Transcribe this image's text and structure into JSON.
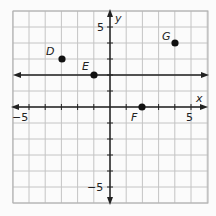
{
  "chart_data": {
    "type": "scatter",
    "title": "",
    "xlabel": "x",
    "ylabel": "y",
    "xlim": [
      -6,
      6
    ],
    "ylim": [
      -6,
      6
    ],
    "grid": true,
    "tick_labels": {
      "x": [
        "-5",
        "5"
      ],
      "y": [
        "5",
        "-5"
      ]
    },
    "points": [
      {
        "label": "D",
        "x": -3,
        "y": 3
      },
      {
        "label": "E",
        "x": -1,
        "y": 2
      },
      {
        "label": "F",
        "x": 2,
        "y": 0
      },
      {
        "label": "G",
        "x": 4,
        "y": 4
      }
    ],
    "lines": [
      {
        "type": "horizontal",
        "y": 2,
        "arrows": "both"
      }
    ]
  },
  "labels": {
    "x_axis": "x",
    "y_axis": "y",
    "x_neg": "−5",
    "x_pos": "5",
    "y_pos": "5",
    "y_neg": "−5",
    "D": "D",
    "E": "E",
    "F": "F",
    "G": "G"
  },
  "colors": {
    "grid": "#b5b5b5",
    "axis": "#222222",
    "point": "#111111",
    "background": "#fbfbfb"
  }
}
